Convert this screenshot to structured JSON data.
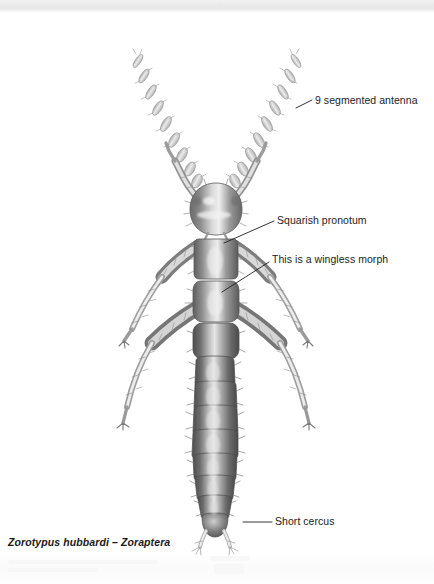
{
  "page": {
    "width": 434,
    "height": 584,
    "background": "#ffffff",
    "header_strip_color": "#eaeaea",
    "ink_color": "#222222"
  },
  "header": {
    "ghost_text": "· ·"
  },
  "figure": {
    "caption_genus_species": "Zorotypus hubbardi",
    "caption_separator": " – ",
    "caption_order": "Zoraptera",
    "caption_full": "Zorotypus hubbardi – Zoraptera"
  },
  "annotations": [
    {
      "id": "antenna",
      "label": "9 segmented antenna",
      "leader": {
        "x1": 296,
        "y1": 108,
        "x2": 312,
        "y2": 100
      }
    },
    {
      "id": "pronotum",
      "label": "Squarish pronotum",
      "leader": {
        "x1": 224,
        "y1": 243,
        "x2": 274,
        "y2": 221
      }
    },
    {
      "id": "wingless",
      "label": "This is a wingless morph",
      "leader": {
        "x1": 222,
        "y1": 292,
        "x2": 269,
        "y2": 262
      }
    },
    {
      "id": "cercus",
      "label": "Short cercus",
      "leader": {
        "x1": 243,
        "y1": 522,
        "x2": 272,
        "y2": 522
      }
    }
  ],
  "anatomy": {
    "antenna_segments": 9,
    "abdomen_segments": 8,
    "leg_pairs": 3,
    "cerci": 2,
    "wings": "absent (apterous morph)"
  }
}
